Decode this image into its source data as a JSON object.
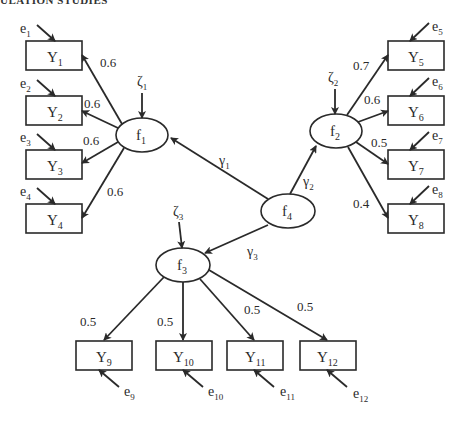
{
  "header": {
    "text": "ULATION STUDIES"
  },
  "diagram": {
    "type": "structural-equation-model",
    "latent_factors": [
      {
        "id": "f1",
        "label": "f",
        "sub": "1",
        "disturbance": {
          "label": "ζ",
          "sub": "1"
        }
      },
      {
        "id": "f2",
        "label": "f",
        "sub": "2",
        "disturbance": {
          "label": "ζ",
          "sub": "2"
        }
      },
      {
        "id": "f3",
        "label": "f",
        "sub": "3",
        "disturbance": {
          "label": "ζ",
          "sub": "3"
        }
      },
      {
        "id": "f4",
        "label": "f",
        "sub": "4"
      }
    ],
    "indicators": [
      {
        "label": "Y",
        "sub": "1",
        "error": {
          "label": "e",
          "sub": "1"
        },
        "factor": "f1",
        "loading": "0.6"
      },
      {
        "label": "Y",
        "sub": "2",
        "error": {
          "label": "e",
          "sub": "2"
        },
        "factor": "f1",
        "loading": "0.6"
      },
      {
        "label": "Y",
        "sub": "3",
        "error": {
          "label": "e",
          "sub": "3"
        },
        "factor": "f1",
        "loading": "0.6"
      },
      {
        "label": "Y",
        "sub": "4",
        "error": {
          "label": "e",
          "sub": "4"
        },
        "factor": "f1",
        "loading": "0.6"
      },
      {
        "label": "Y",
        "sub": "5",
        "error": {
          "label": "e",
          "sub": "5"
        },
        "factor": "f2",
        "loading": "0.7"
      },
      {
        "label": "Y",
        "sub": "6",
        "error": {
          "label": "e",
          "sub": "6"
        },
        "factor": "f2",
        "loading": "0.6"
      },
      {
        "label": "Y",
        "sub": "7",
        "error": {
          "label": "e",
          "sub": "7"
        },
        "factor": "f2",
        "loading": "0.5"
      },
      {
        "label": "Y",
        "sub": "8",
        "error": {
          "label": "e",
          "sub": "8"
        },
        "factor": "f2",
        "loading": "0.4"
      },
      {
        "label": "Y",
        "sub": "9",
        "error": {
          "label": "e",
          "sub": "9"
        },
        "factor": "f3",
        "loading": "0.5"
      },
      {
        "label": "Y",
        "sub": "10",
        "error": {
          "label": "e",
          "sub": "10"
        },
        "factor": "f3",
        "loading": "0.5"
      },
      {
        "label": "Y",
        "sub": "11",
        "error": {
          "label": "e",
          "sub": "11"
        },
        "factor": "f3",
        "loading": "0.5"
      },
      {
        "label": "Y",
        "sub": "12",
        "error": {
          "label": "e",
          "sub": "12"
        },
        "factor": "f3",
        "loading": "0.5"
      }
    ],
    "structural_paths": [
      {
        "from": "f4",
        "to": "f1",
        "label": "γ",
        "sub": "1"
      },
      {
        "from": "f4",
        "to": "f2",
        "label": "γ",
        "sub": "2"
      },
      {
        "from": "f4",
        "to": "f3",
        "label": "γ",
        "sub": "3"
      }
    ]
  }
}
